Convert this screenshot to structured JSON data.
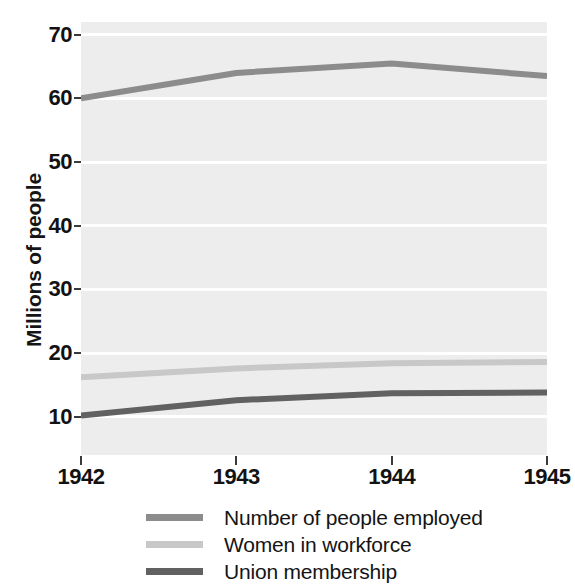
{
  "chart_data": {
    "type": "line",
    "title": "",
    "xlabel": "",
    "ylabel": "Millions of people",
    "x": [
      1942,
      1943,
      1944,
      1945
    ],
    "xtick_labels": [
      "1942",
      "1943",
      "1944",
      "1945"
    ],
    "ytick_labels": [
      "70",
      "60",
      "50",
      "40",
      "30",
      "20",
      "10"
    ],
    "ytick_values": [
      70,
      60,
      50,
      40,
      30,
      20,
      10
    ],
    "ylim": [
      4,
      72
    ],
    "xlim": [
      1942,
      1945
    ],
    "grid": "horizontal",
    "legend_position": "bottom",
    "plot_background": "#ededed",
    "gridline_color": "#ffffff",
    "series": [
      {
        "name": "Number of people employed",
        "color": "#8c8c8c",
        "values": [
          60.0,
          64.0,
          65.5,
          63.5
        ]
      },
      {
        "name": "Women in workforce",
        "color": "#c8c8c8",
        "values": [
          16.2,
          17.6,
          18.4,
          18.6
        ]
      },
      {
        "name": "Union membership",
        "color": "#616161",
        "values": [
          10.2,
          12.6,
          13.7,
          13.8
        ]
      }
    ]
  },
  "axis": {
    "y_title": "Millions of people"
  },
  "legend": {
    "items": [
      {
        "label": "Number of people employed",
        "color": "#8c8c8c"
      },
      {
        "label": "Women in workforce",
        "color": "#c8c8c8"
      },
      {
        "label": "Union membership",
        "color": "#616161"
      }
    ]
  }
}
